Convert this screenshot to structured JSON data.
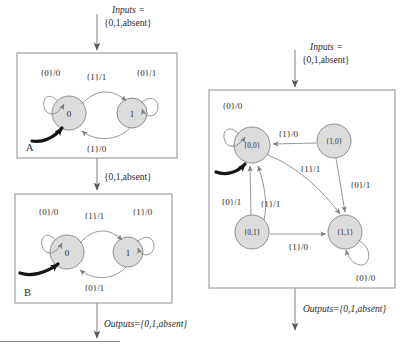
{
  "figure": {
    "colors": {
      "state_fill": "#dcdcdc",
      "state_stroke": "#7f7f7f",
      "edge_stroke": "#8a8a8a",
      "box_stroke": "#8d8d8d",
      "text": "#2b2b2b",
      "initial_arrow": "#141414"
    }
  },
  "left_column": {
    "top_input_label": {
      "line1": "Inputs =",
      "line2": "{0,1,absent}"
    },
    "between_label": "{0,1,absent}",
    "bottom_output_label": "Outputs={0,1,absent}",
    "machine_a": {
      "name": "A",
      "states": [
        {
          "id": "s0",
          "label": "0",
          "initial": true
        },
        {
          "id": "s1",
          "label": "1",
          "initial": false
        }
      ],
      "transitions": [
        {
          "from": "s0",
          "to": "s0",
          "label": "{0}/0",
          "kind": "self-loop"
        },
        {
          "from": "s0",
          "to": "s1",
          "label": "{1}/1",
          "kind": "arc-top"
        },
        {
          "from": "s1",
          "to": "s1",
          "label": "{0}/1",
          "kind": "self-loop"
        },
        {
          "from": "s1",
          "to": "s0",
          "label": "{1}/0",
          "kind": "arc-bottom"
        }
      ]
    },
    "machine_b": {
      "name": "B",
      "states": [
        {
          "id": "s0",
          "label": "0",
          "initial": true
        },
        {
          "id": "s1",
          "label": "1",
          "initial": false
        }
      ],
      "transitions": [
        {
          "from": "s0",
          "to": "s0",
          "label": "{0}/0",
          "kind": "self-loop"
        },
        {
          "from": "s0",
          "to": "s1",
          "label": "{1}/1",
          "kind": "arc-top"
        },
        {
          "from": "s1",
          "to": "s1",
          "label": "{1}/0",
          "kind": "self-loop"
        },
        {
          "from": "s1",
          "to": "s0",
          "label": "{0}/1",
          "kind": "arc-bottom"
        }
      ]
    }
  },
  "right_column": {
    "top_input_label": {
      "line1": "Inputs =",
      "line2": "{0,1,absent}"
    },
    "bottom_output_label": "Outputs={0,1,absent}",
    "machine_product": {
      "states": [
        {
          "id": "s00",
          "label": "{0,0}",
          "initial": true
        },
        {
          "id": "s10",
          "label": "{1,0}",
          "initial": false
        },
        {
          "id": "s01",
          "label": "{0,1}",
          "initial": false
        },
        {
          "id": "s11",
          "label": "{1,1}",
          "initial": false
        }
      ],
      "transitions": [
        {
          "from": "s00",
          "to": "s00",
          "label": "{0}/0",
          "kind": "self-loop"
        },
        {
          "from": "s10",
          "to": "s00",
          "label": "{1}/0",
          "kind": "straight"
        },
        {
          "from": "s00",
          "to": "s11",
          "label": "{1}/1",
          "kind": "curve"
        },
        {
          "from": "s10",
          "to": "s11",
          "label": "{0}/1",
          "kind": "straight"
        },
        {
          "from": "s01",
          "to": "s00",
          "label": "{0}/1",
          "kind": "straight"
        },
        {
          "from": "s01",
          "to": "s00",
          "label": "{1}/1",
          "kind": "curve"
        },
        {
          "from": "s01",
          "to": "s11",
          "label": "{1}/0",
          "kind": "straight"
        },
        {
          "from": "s11",
          "to": "s11",
          "label": "{0}/0",
          "kind": "self-loop"
        }
      ]
    }
  }
}
